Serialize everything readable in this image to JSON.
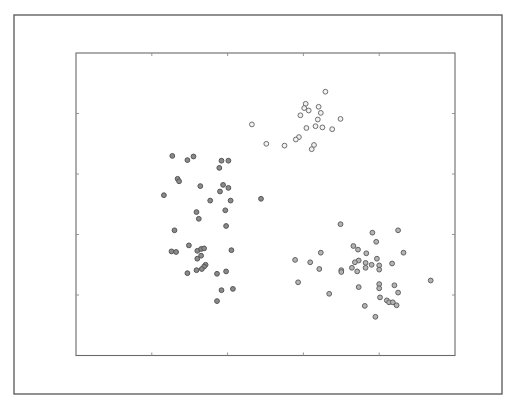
{
  "chart_data": {
    "type": "scatter",
    "title": "",
    "xlabel": "",
    "ylabel": "",
    "xlim": [
      0,
      5
    ],
    "ylim": [
      0,
      5
    ],
    "x_ticks": [
      1,
      2,
      3,
      4
    ],
    "y_ticks": [
      1,
      2,
      3,
      4
    ],
    "x_tick_labels": [],
    "y_tick_labels": [],
    "grid": false,
    "legend": null,
    "note": "Axes show tick marks only (no tick labels); coordinates are normalized so tick marks fall on integers.",
    "series": [
      {
        "name": "cluster-left",
        "marker_fill": "#8a8a8a",
        "marker_edge": "#555555",
        "points": [
          [
            1.27,
            3.3
          ],
          [
            1.47,
            3.23
          ],
          [
            1.55,
            3.29
          ],
          [
            1.92,
            3.22
          ],
          [
            2.01,
            3.22
          ],
          [
            1.89,
            3.1
          ],
          [
            1.34,
            2.92
          ],
          [
            1.36,
            2.88
          ],
          [
            1.64,
            2.8
          ],
          [
            1.94,
            2.82
          ],
          [
            2.01,
            2.77
          ],
          [
            1.9,
            2.71
          ],
          [
            1.16,
            2.65
          ],
          [
            1.77,
            2.56
          ],
          [
            2.04,
            2.56
          ],
          [
            2.44,
            2.59
          ],
          [
            1.97,
            2.4
          ],
          [
            1.59,
            2.37
          ],
          [
            1.62,
            2.26
          ],
          [
            1.98,
            2.14
          ],
          [
            1.3,
            2.07
          ],
          [
            1.49,
            1.82
          ],
          [
            1.26,
            1.72
          ],
          [
            1.32,
            1.71
          ],
          [
            1.6,
            1.73
          ],
          [
            1.65,
            1.76
          ],
          [
            1.69,
            1.77
          ],
          [
            2.05,
            1.74
          ],
          [
            1.65,
            1.65
          ],
          [
            1.6,
            1.6
          ],
          [
            1.71,
            1.5
          ],
          [
            1.69,
            1.47
          ],
          [
            1.66,
            1.43
          ],
          [
            1.59,
            1.41
          ],
          [
            1.47,
            1.36
          ],
          [
            1.86,
            1.35
          ],
          [
            1.98,
            1.39
          ],
          [
            1.92,
            1.08
          ],
          [
            2.07,
            1.1
          ],
          [
            1.86,
            0.9
          ]
        ]
      },
      {
        "name": "cluster-upper-right",
        "marker_fill": "#f2f2f2",
        "marker_edge": "#6e6e6e",
        "points": [
          [
            3.29,
            4.36
          ],
          [
            3.03,
            4.16
          ],
          [
            3.01,
            4.09
          ],
          [
            3.07,
            4.05
          ],
          [
            3.2,
            4.11
          ],
          [
            3.23,
            4.01
          ],
          [
            2.96,
            3.97
          ],
          [
            3.19,
            3.9
          ],
          [
            3.49,
            3.91
          ],
          [
            2.32,
            3.82
          ],
          [
            3.04,
            3.76
          ],
          [
            3.16,
            3.79
          ],
          [
            3.25,
            3.77
          ],
          [
            3.38,
            3.74
          ],
          [
            2.94,
            3.61
          ],
          [
            2.9,
            3.57
          ],
          [
            2.51,
            3.5
          ],
          [
            2.75,
            3.47
          ],
          [
            3.14,
            3.48
          ],
          [
            3.11,
            3.41
          ]
        ]
      },
      {
        "name": "cluster-lower-right",
        "marker_fill": "#b4b4b4",
        "marker_edge": "#606060",
        "points": [
          [
            3.49,
            2.17
          ],
          [
            3.91,
            2.03
          ],
          [
            4.25,
            2.07
          ],
          [
            3.96,
            1.88
          ],
          [
            3.66,
            1.81
          ],
          [
            3.72,
            1.75
          ],
          [
            3.83,
            1.69
          ],
          [
            4.32,
            1.7
          ],
          [
            3.23,
            1.7
          ],
          [
            3.97,
            1.6
          ],
          [
            3.73,
            1.57
          ],
          [
            3.68,
            1.54
          ],
          [
            3.82,
            1.53
          ],
          [
            3.9,
            1.5
          ],
          [
            4.0,
            1.49
          ],
          [
            4.17,
            1.52
          ],
          [
            2.89,
            1.58
          ],
          [
            3.09,
            1.54
          ],
          [
            3.64,
            1.45
          ],
          [
            3.82,
            1.45
          ],
          [
            4.0,
            1.42
          ],
          [
            3.5,
            1.41
          ],
          [
            3.5,
            1.38
          ],
          [
            3.71,
            1.39
          ],
          [
            3.21,
            1.43
          ],
          [
            4.68,
            1.24
          ],
          [
            4.0,
            1.18
          ],
          [
            4.0,
            1.11
          ],
          [
            4.2,
            1.16
          ],
          [
            3.73,
            1.13
          ],
          [
            4.25,
            1.04
          ],
          [
            2.93,
            1.21
          ],
          [
            4.01,
            0.96
          ],
          [
            4.1,
            0.91
          ],
          [
            4.13,
            0.88
          ],
          [
            4.18,
            0.88
          ],
          [
            4.23,
            0.83
          ],
          [
            3.81,
            0.82
          ],
          [
            3.34,
            1.02
          ],
          [
            3.95,
            0.64
          ]
        ]
      }
    ]
  },
  "style": {
    "background": "#ffffff",
    "frame_color": "#555555",
    "axis_color": "#6a6a6a",
    "tick_color": "#8a8a8a"
  }
}
